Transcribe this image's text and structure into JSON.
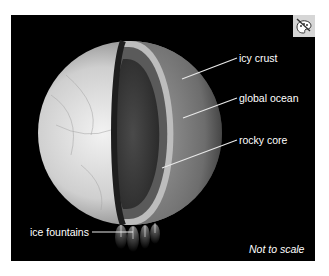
{
  "figure": {
    "labels": {
      "icy_crust": "icy crust",
      "global_ocean": "global ocean",
      "rocky_core": "rocky core",
      "ice_fountains": "ice fountains"
    },
    "note": "Not to scale",
    "badge_icon": "artist-palette-icon",
    "colors": {
      "background": "#000000",
      "surface": "#d8d8d8",
      "crust": "#bdbdbd",
      "ocean": "#5a5a5a",
      "core": "#333333",
      "label_text": "#ffffff",
      "badge_bg": "#d6d6d6"
    }
  }
}
